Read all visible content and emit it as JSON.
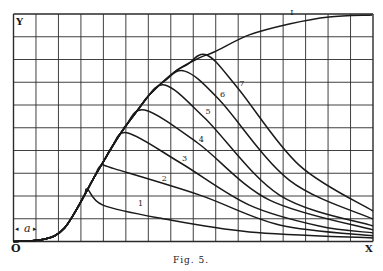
{
  "chart_data": {
    "type": "line",
    "title": "",
    "caption": "Fig. 5.",
    "xlabel": "X",
    "ylabel": "Y",
    "origin_label": "O",
    "delay_annotation": "a",
    "xlim": [
      0,
      16
    ],
    "ylim": [
      0,
      10
    ],
    "grid": true,
    "grid_cells": {
      "x": 16,
      "y": 10
    },
    "series": [
      {
        "name": "I",
        "role": "envelope",
        "points": [
          [
            0,
            0
          ],
          [
            1.16,
            0.07
          ],
          [
            1.82,
            0.24
          ],
          [
            2.27,
            0.59
          ],
          [
            2.71,
            1.25
          ],
          [
            3.16,
            2.04
          ],
          [
            3.6,
            2.84
          ],
          [
            4.04,
            3.58
          ],
          [
            4.49,
            4.33
          ],
          [
            4.93,
            4.99
          ],
          [
            5.6,
            5.87
          ],
          [
            6.04,
            6.44
          ],
          [
            7.16,
            7.45
          ],
          [
            8.27,
            8.07
          ],
          [
            8.93,
            8.33
          ],
          [
            10.49,
            9.08
          ],
          [
            12.27,
            9.56
          ],
          [
            14.04,
            9.87
          ],
          [
            15.96,
            9.96
          ]
        ],
        "label_at": [
          12.27,
          9.9
        ]
      },
      {
        "name": "1",
        "depart_x": 3.3,
        "peak": [
          3.98,
          1.6
        ],
        "descent": [
          [
            6.51,
            1.03
          ],
          [
            10.5,
            0.42
          ]
        ],
        "end": [
          16,
          0.16
        ],
        "label_at": [
          5.5,
          1.5
        ]
      },
      {
        "name": "2",
        "depart_x": 3.9,
        "peak": [
          4.51,
          3.19
        ],
        "descent": [
          [
            8.29,
            2.04
          ],
          [
            11.84,
            0.73
          ]
        ],
        "end": [
          16,
          0.25
        ],
        "label_at": [
          6.55,
          2.6
        ]
      },
      {
        "name": "3",
        "depart_x": 4.4,
        "peak": [
          5.09,
          4.77
        ],
        "descent": [
          [
            7.44,
            3.45
          ],
          [
            10.5,
            1.6
          ],
          [
            13.6,
            0.68
          ]
        ],
        "end": [
          16,
          0.38
        ],
        "label_at": [
          7.45,
          3.5
        ]
      },
      {
        "name": "4",
        "depart_x": 5.0,
        "peak": [
          5.84,
          5.78
        ],
        "descent": [
          [
            8.2,
            4.33
          ],
          [
            11.4,
            1.82
          ]
        ],
        "end": [
          16,
          0.51
        ],
        "label_at": [
          8.2,
          4.35
        ]
      },
      {
        "name": "5",
        "depart_x": 5.8,
        "peak": [
          6.73,
          6.88
        ],
        "descent": [
          [
            8.51,
            5.43
          ],
          [
            11.84,
            2.04
          ]
        ],
        "end": [
          16,
          0.68
        ],
        "label_at": [
          8.5,
          5.55
        ]
      },
      {
        "name": "6",
        "depart_x": 6.7,
        "peak": [
          7.62,
          7.49
        ],
        "descent": [
          [
            9.13,
            6.26
          ],
          [
            12.27,
            2.7
          ]
        ],
        "end": [
          16,
          0.99
        ],
        "label_at": [
          9.15,
          6.3
        ]
      },
      {
        "name": "7",
        "depart_x": 7.7,
        "peak": [
          8.6,
          8.2
        ],
        "descent": [
          [
            9.98,
            6.75
          ],
          [
            12.71,
            3.36
          ]
        ],
        "end": [
          16,
          1.34
        ],
        "label_at": [
          10.0,
          6.8
        ]
      }
    ]
  }
}
